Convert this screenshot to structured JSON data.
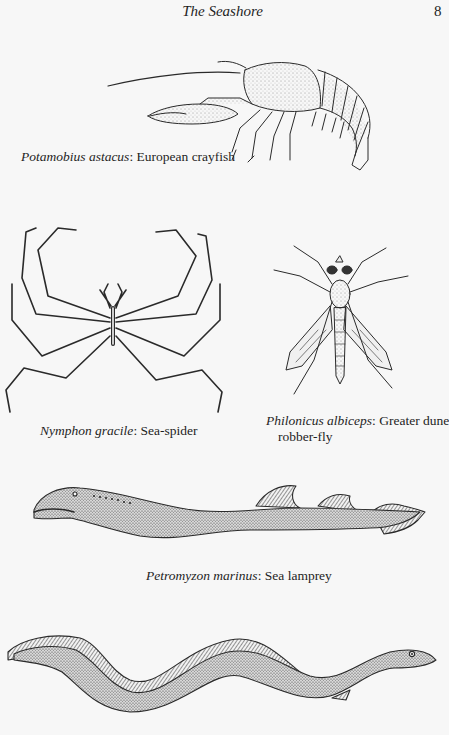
{
  "header": {
    "title": "The Seashore",
    "page_number": "8"
  },
  "figures": [
    {
      "id": "crayfish",
      "illustration": "european-crayfish-illustration",
      "caption": {
        "scientific_name": "Potamobius astacus",
        "separator": ": ",
        "common_name": "European crayfish"
      }
    },
    {
      "id": "sea-spider",
      "illustration": "sea-spider-illustration",
      "caption": {
        "scientific_name": "Nymphon gracile",
        "separator": ": ",
        "common_name": "Sea-spider"
      }
    },
    {
      "id": "robber-fly",
      "illustration": "robber-fly-illustration",
      "caption": {
        "scientific_name": "Philonicus albiceps",
        "separator": ": ",
        "common_name_line1": "Greater dune",
        "common_name_line2": "robber-fly"
      }
    },
    {
      "id": "sea-lamprey",
      "illustration": "sea-lamprey-illustration",
      "caption": {
        "scientific_name": "Petromyzon marinus",
        "separator": ": ",
        "common_name": "Sea lamprey"
      }
    },
    {
      "id": "eel",
      "illustration": "eel-illustration",
      "caption": null
    }
  ],
  "colors": {
    "paper": "#f7f7f7",
    "ink": "#1e1e1e"
  }
}
